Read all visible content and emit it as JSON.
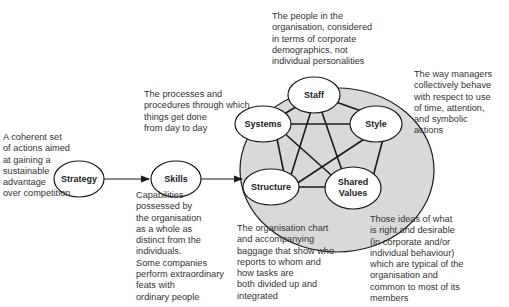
{
  "diagram": {
    "nodes": {
      "strategy": "Strategy",
      "skills": "Skills",
      "staff": "Staff",
      "systems": "Systems",
      "style": "Style",
      "structure": "Structure",
      "shared_values_line1": "Shared",
      "shared_values_line2": "Values"
    },
    "descriptions": {
      "strategy": "A coherent set\nof actions aimed\nat gaining a\nsustainable\nadvantage\nover competition",
      "systems": "The processes and\nprocedures through which\nthings get done\nfrom day to day",
      "staff": "The people in the\norganisation, considered\nin terms of corporate\ndemographics, not\nindividual personalities",
      "style": "The way managers\ncollectively behave\nwith respect to use\nof time, attention,\nand symbolic\nactions",
      "skills": "Capabilities\npossessed by\nthe organisation\nas a whole as\ndistinct from the\nindividuals.\nSome companies\nperform extraordinary\nfeats with\nordinary people",
      "structure": "The organisation chart\nand accompanying\nbaggage that show who\nreports to whom and\nhow tasks are\nboth divided up and\nintegrated",
      "shared_values": "Those ideas of what\nis right and desirable\n(in corporate and/or\nindividual behaviour)\nwhich are typical of the\norganisation and\ncommon to most of its\nmembers"
    },
    "colors": {
      "outer_circle_fill": "#d9d9d9",
      "node_fill": "#ffffff",
      "stroke": "#1a1a1a"
    }
  }
}
